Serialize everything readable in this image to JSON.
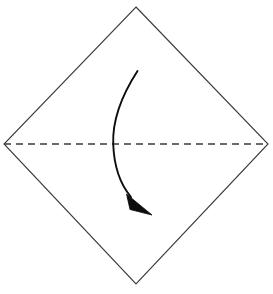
{
  "canvas": {
    "width": 273,
    "height": 294,
    "background_color": "#ffffff"
  },
  "diagram": {
    "title": "origami valley fold diagram",
    "shape_name": "square-sheet-diamond-orientation"
  },
  "paper": {
    "name": "paper-outline",
    "fill_color": "#ffffff",
    "stroke_color": "#3a3a3a",
    "stroke_width": 1.1,
    "points": "136,7 268,144 136,284 4,144",
    "vertices": {
      "top": [
        136,
        7
      ],
      "right": [
        268,
        144
      ],
      "bottom": [
        136,
        284
      ],
      "left": [
        4,
        144
      ]
    }
  },
  "fold_line": {
    "name": "horizontal-dashed-fold-line",
    "type": "valley-fold",
    "stroke_color": "#3a3a3a",
    "stroke_width": 1.4,
    "dash_pattern": "7,5",
    "x1": 4,
    "y1": 144,
    "x2": 268,
    "y2": 144
  },
  "fold_arrow": {
    "name": "curved-fold-arrow",
    "direction": "top-half-folds-down",
    "stroke_color": "#0d0d0d",
    "stroke_width": 1.9,
    "path": "M 137.5 71 C 120 98, 112.5 124, 113.2 144 C 114 165, 120 184, 131 197",
    "start_point": [
      137.5,
      71
    ],
    "crossing_point": [
      113,
      144
    ],
    "end_point": [
      131,
      197
    ],
    "arrowhead": {
      "name": "arrowhead-triangle",
      "fill_color": "#0d0d0d",
      "tip": [
        152,
        215
      ],
      "points": "152,215 126.5,194 130,209.5"
    }
  }
}
